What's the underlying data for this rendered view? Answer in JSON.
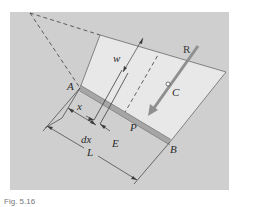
{
  "figure": {
    "labels": {
      "A": "A",
      "B": "B",
      "C": "C",
      "E": "E",
      "P": "P",
      "R": "R",
      "w": "w",
      "x": "x",
      "dx": "dx",
      "L": "L"
    },
    "caption": "Fig. 5.16"
  },
  "colors": {
    "background_panel": "#cfcfcf",
    "plate_fill": "#e6e6e6",
    "gate_strip": "#a9a9a9",
    "line": "#3c3c3c",
    "force_arrow": "#8a8a8a"
  }
}
